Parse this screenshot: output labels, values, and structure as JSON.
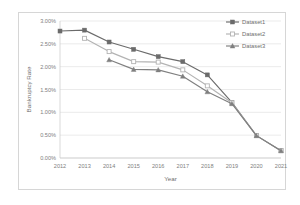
{
  "chart_data": {
    "type": "line",
    "title": "",
    "xlabel": "Year",
    "ylabel": "Bankruptcy Rate",
    "categories": [
      "2012",
      "2013",
      "2014",
      "2015",
      "2016",
      "2017",
      "2018",
      "2019",
      "2020",
      "2021"
    ],
    "x": [
      2012,
      2013,
      2014,
      2015,
      2016,
      2017,
      2018,
      2019,
      2020,
      2021
    ],
    "ylim": [
      0.0,
      3.0
    ],
    "xlim": [
      2012,
      2021
    ],
    "ytick_labels": [
      "0.00%",
      "0.50%",
      "1.00%",
      "1.50%",
      "2.00%",
      "2.50%",
      "3.00%"
    ],
    "ytick_values": [
      0.0,
      0.5,
      1.0,
      1.5,
      2.0,
      2.5,
      3.0
    ],
    "xtick_labels": [
      "2012",
      "2013",
      "2014",
      "2015",
      "2016",
      "2017",
      "2018",
      "2019",
      "2020",
      "2021"
    ],
    "grid": "horizontal",
    "legend_position": "top-right",
    "series": [
      {
        "name": "Dataset1",
        "color": "#6b6b6b",
        "marker": "square-filled",
        "values": [
          2.78,
          2.8,
          2.54,
          2.38,
          2.22,
          2.11,
          1.82,
          1.22,
          0.49,
          0.16
        ]
      },
      {
        "name": "Dataset2",
        "color": "#b3b3b3",
        "marker": "square-hollow",
        "values": [
          null,
          2.62,
          2.33,
          2.11,
          2.1,
          1.93,
          1.58,
          1.21,
          0.49,
          0.16
        ]
      },
      {
        "name": "Dataset3",
        "color": "#7f7f7f",
        "marker": "triangle-filled",
        "values": [
          null,
          null,
          2.15,
          1.94,
          1.93,
          1.79,
          1.45,
          1.19,
          0.49,
          0.16
        ]
      }
    ]
  },
  "legend": {
    "entries": [
      {
        "label": "Dataset1"
      },
      {
        "label": "Dataset2"
      },
      {
        "label": "Dataset3"
      }
    ]
  },
  "axes": {
    "y_title": "Bankruptcy Rate",
    "x_title": "Year"
  }
}
